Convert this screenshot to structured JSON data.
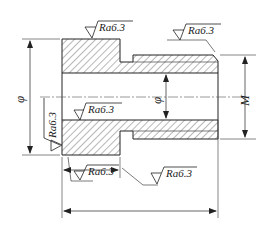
{
  "drawing": {
    "type": "sectional view of stepped bushing",
    "roughness_symbols": [
      {
        "id": "top-flange",
        "text": "Ra6.3"
      },
      {
        "id": "top-right-chamfer",
        "text": "Ra6.3"
      },
      {
        "id": "left-face",
        "text": "Ra6.3"
      },
      {
        "id": "bore",
        "text": "Ra6.3"
      },
      {
        "id": "bottom-left",
        "text": "Ra6.3"
      },
      {
        "id": "bottom-step",
        "text": "Ra6.3"
      }
    ],
    "dimensions": {
      "outer_diameter": "φ",
      "bore_diameter": "φ",
      "thread": "M"
    }
  }
}
